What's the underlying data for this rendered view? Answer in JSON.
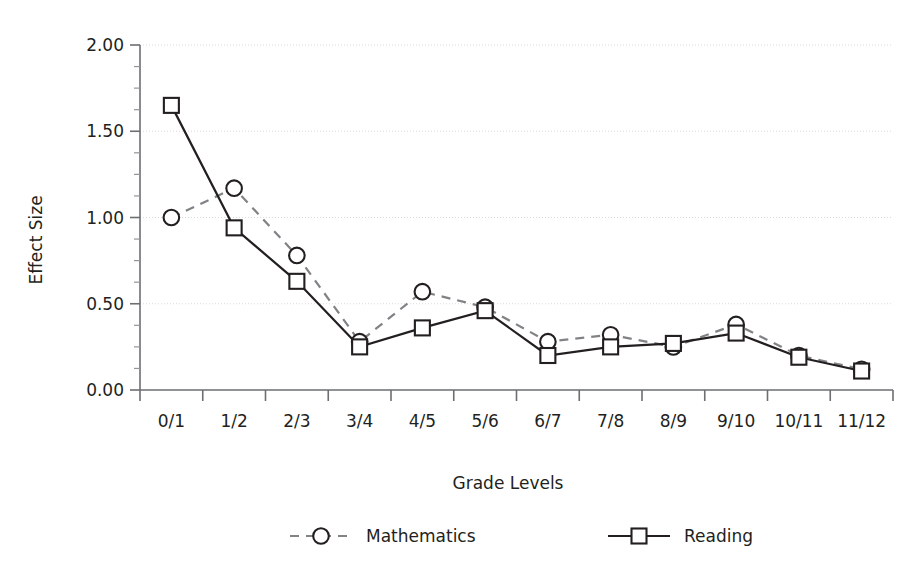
{
  "chart_data": {
    "type": "line",
    "title": "",
    "xlabel": "Grade Levels",
    "ylabel": "Effect Size",
    "categories": [
      "0/1",
      "1/2",
      "2/3",
      "3/4",
      "4/5",
      "5/6",
      "6/7",
      "7/8",
      "8/9",
      "9/10",
      "10/11",
      "11/12"
    ],
    "series": [
      {
        "name": "Mathematics",
        "marker": "circle",
        "linestyle": "dashed",
        "color": "#808285",
        "values": [
          1.0,
          1.17,
          0.78,
          0.28,
          0.57,
          0.48,
          0.28,
          0.32,
          0.25,
          0.38,
          0.2,
          0.12
        ]
      },
      {
        "name": "Reading",
        "marker": "square",
        "linestyle": "solid",
        "color": "#231f20",
        "values": [
          1.65,
          0.94,
          0.63,
          0.25,
          0.36,
          0.46,
          0.2,
          0.25,
          0.27,
          0.33,
          0.19,
          0.11
        ]
      }
    ],
    "ylim": [
      0.0,
      2.0
    ],
    "ytick_values": [
      0.0,
      0.5,
      1.0,
      1.5,
      2.0
    ],
    "ytick_labels": [
      "0.00",
      "0.50",
      "1.00",
      "1.50",
      "2.00"
    ],
    "yminor_step": 0.125,
    "grid": true,
    "grid_axis": "y",
    "legend_position": "bottom",
    "legend_entries": [
      {
        "label": "Mathematics",
        "marker": "circle",
        "linestyle": "dashed"
      },
      {
        "label": "Reading",
        "marker": "square",
        "linestyle": "solid"
      }
    ]
  },
  "colors": {
    "background": "#ffffff",
    "axis": "#6d6e71",
    "grid": "#d9dadb",
    "text": "#231f20",
    "mathematics": "#808285",
    "reading": "#231f20"
  }
}
